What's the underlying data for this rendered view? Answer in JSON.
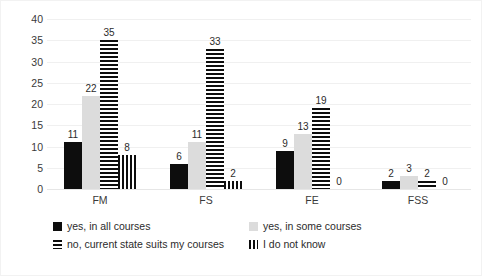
{
  "chart_data": {
    "type": "bar",
    "title": "",
    "subtitle": "",
    "xlabel": "",
    "ylabel": "",
    "categories": [
      "FM",
      "FS",
      "FE",
      "FSS"
    ],
    "ylim": [
      0,
      40
    ],
    "yticks": [
      0,
      5,
      10,
      15,
      20,
      25,
      30,
      35,
      40
    ],
    "grid": true,
    "legend_position": "bottom",
    "series": [
      {
        "name": "yes, in all courses",
        "pattern": "solid-black",
        "color": "#0d0d0d",
        "values": [
          11,
          6,
          9,
          2
        ]
      },
      {
        "name": "yes, in some courses",
        "pattern": "solid-light-gray",
        "color": "#dcdcdc",
        "values": [
          22,
          11,
          13,
          3
        ]
      },
      {
        "name": "no, current state suits my courses",
        "pattern": "horizontal-stripes",
        "color": "#0d0d0d",
        "values": [
          35,
          33,
          19,
          2
        ]
      },
      {
        "name": "I do not know",
        "pattern": "vertical-stripes",
        "color": "#0d0d0d",
        "values": [
          8,
          2,
          0,
          0
        ]
      }
    ]
  }
}
